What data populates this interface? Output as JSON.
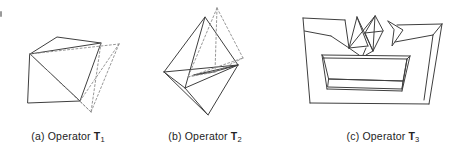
{
  "page": {
    "background_color": "#ffffff",
    "line_color": "#3f3f3f",
    "dashed_line_color": "#8c8c8c",
    "text_color": "#232323"
  },
  "figure": {
    "panels": [
      {
        "caption_prefix": "(a) Operator",
        "operator_symbol": "T",
        "operator_subscript": "1",
        "drawing": "truncated-cube-with-dashed-tetrahedron"
      },
      {
        "caption_prefix": "(b) Operator",
        "operator_symbol": "T",
        "operator_subscript": "2",
        "drawing": "octahedron-with-dashed-tetrahedron"
      },
      {
        "caption_prefix": "(c) Operator",
        "operator_symbol": "T",
        "operator_subscript": "3",
        "drawing": "notched-block-with-pyramids"
      }
    ]
  }
}
